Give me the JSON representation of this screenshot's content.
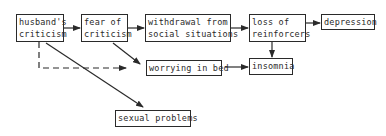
{
  "diagram": {
    "nodes": [
      {
        "id": "husbands-criticism",
        "label": "husband's\ncriticism"
      },
      {
        "id": "fear-of-criticism",
        "label": "fear of\ncriticism"
      },
      {
        "id": "withdrawal",
        "label": "withdrawal from\nsocial situations"
      },
      {
        "id": "loss-of-reinforcers",
        "label": "loss of\nreinforcers"
      },
      {
        "id": "depression",
        "label": "depression"
      },
      {
        "id": "worrying-in-bed",
        "label": "worrying in bed"
      },
      {
        "id": "insomnia",
        "label": "insomnia"
      },
      {
        "id": "sexual-problems",
        "label": "sexual problems"
      }
    ],
    "edges": [
      {
        "from": "husbands-criticism",
        "to": "fear-of-criticism",
        "style": "solid"
      },
      {
        "from": "fear-of-criticism",
        "to": "withdrawal",
        "style": "solid"
      },
      {
        "from": "withdrawal",
        "to": "loss-of-reinforcers",
        "style": "solid"
      },
      {
        "from": "loss-of-reinforcers",
        "to": "depression",
        "style": "solid"
      },
      {
        "from": "loss-of-reinforcers",
        "to": "insomnia",
        "style": "solid"
      },
      {
        "from": "fear-of-criticism",
        "to": "worrying-in-bed",
        "style": "solid"
      },
      {
        "from": "husbands-criticism",
        "to": "worrying-in-bed",
        "style": "dashed"
      },
      {
        "from": "husbands-criticism",
        "to": "sexual-problems",
        "style": "solid"
      },
      {
        "from": "worrying-in-bed",
        "to": "insomnia",
        "style": "solid"
      }
    ],
    "colors": {
      "line": "#2a2a2a",
      "background": "#ffffff"
    }
  }
}
